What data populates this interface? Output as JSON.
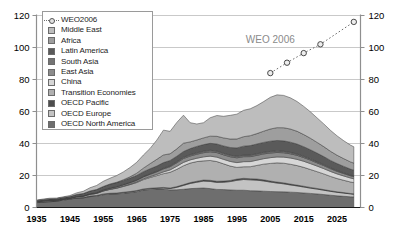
{
  "chart_data": {
    "type": "area",
    "stacked": true,
    "title": "",
    "xlabel": "",
    "ylabel": "",
    "xlim": [
      1935,
      2032
    ],
    "ylim": [
      0,
      120
    ],
    "yticks": [
      0,
      20,
      40,
      60,
      80,
      100,
      120
    ],
    "xticks": [
      1935,
      1945,
      1955,
      1965,
      1975,
      1985,
      1995,
      2005,
      2015,
      2025
    ],
    "grid": true,
    "dual_axis": true,
    "legend_position": "top-left",
    "annotations": [
      {
        "text": "WEO 2006",
        "x": 2005,
        "y": 103,
        "color": "#8a8a8a"
      }
    ],
    "x": [
      1935,
      1937,
      1939,
      1941,
      1943,
      1945,
      1947,
      1949,
      1951,
      1953,
      1955,
      1957,
      1959,
      1961,
      1963,
      1965,
      1967,
      1969,
      1971,
      1973,
      1975,
      1977,
      1979,
      1981,
      1983,
      1985,
      1987,
      1989,
      1991,
      1993,
      1995,
      1997,
      1999,
      2001,
      2003,
      2005,
      2007,
      2009,
      2011,
      2013,
      2015,
      2017,
      2019,
      2021,
      2023,
      2025,
      2027,
      2029,
      2030
    ],
    "series": [
      {
        "name": "OECD North America",
        "color": "#6e6e6e",
        "values": [
          3.0,
          3.4,
          3.6,
          3.9,
          4.6,
          5.2,
          5.9,
          6.0,
          6.8,
          7.1,
          8.0,
          8.4,
          8.5,
          8.9,
          9.3,
          9.9,
          10.9,
          11.3,
          11.5,
          11.6,
          11.0,
          11.1,
          11.4,
          11.8,
          12.0,
          12.2,
          11.8,
          11.3,
          11.2,
          11.0,
          10.8,
          10.8,
          10.5,
          10.4,
          10.2,
          10.0,
          9.9,
          9.8,
          9.6,
          9.4,
          9.1,
          8.8,
          8.5,
          8.1,
          7.7,
          7.3,
          7.0,
          6.7,
          6.6
        ]
      },
      {
        "name": "OECD Europe",
        "color": "#c3c3c3",
        "values": [
          0.2,
          0.2,
          0.2,
          0.2,
          0.3,
          0.2,
          0.2,
          0.2,
          0.3,
          0.3,
          0.4,
          0.4,
          0.4,
          0.5,
          0.5,
          0.5,
          0.5,
          0.5,
          0.5,
          0.6,
          0.8,
          1.5,
          2.4,
          3.2,
          3.8,
          4.3,
          4.5,
          4.4,
          4.6,
          5.2,
          6.2,
          6.7,
          6.8,
          6.7,
          6.4,
          5.9,
          5.4,
          5.0,
          4.5,
          4.1,
          3.7,
          3.3,
          3.0,
          2.7,
          2.4,
          2.2,
          2.0,
          1.8,
          1.7
        ]
      },
      {
        "name": "OECD Pacific",
        "color": "#4d4d4d",
        "values": [
          0.05,
          0.05,
          0.05,
          0.05,
          0.05,
          0.05,
          0.05,
          0.05,
          0.1,
          0.1,
          0.1,
          0.1,
          0.15,
          0.15,
          0.2,
          0.2,
          0.2,
          0.25,
          0.3,
          0.35,
          0.4,
          0.45,
          0.5,
          0.55,
          0.6,
          0.65,
          0.7,
          0.7,
          0.7,
          0.7,
          0.75,
          0.75,
          0.7,
          0.7,
          0.7,
          0.65,
          0.6,
          0.6,
          0.55,
          0.5,
          0.5,
          0.45,
          0.4,
          0.4,
          0.35,
          0.3,
          0.3,
          0.25,
          0.25
        ]
      },
      {
        "name": "Transition Economies",
        "color": "#b0b0b0",
        "values": [
          0.4,
          0.5,
          0.6,
          0.5,
          0.4,
          0.4,
          0.6,
          0.8,
          1.0,
          1.3,
          1.8,
          2.4,
          3.0,
          3.6,
          4.3,
          5.0,
          5.8,
          6.7,
          7.6,
          8.6,
          9.8,
          10.8,
          11.8,
          12.2,
          12.3,
          12.0,
          12.4,
          12.3,
          10.8,
          9.0,
          7.3,
          7.2,
          7.5,
          8.5,
          9.8,
          11.0,
          12.0,
          12.3,
          12.4,
          12.2,
          11.8,
          11.2,
          10.5,
          9.8,
          9.0,
          8.3,
          7.7,
          7.2,
          7.0
        ]
      },
      {
        "name": "China",
        "color": "#d6d6d6",
        "values": [
          0.01,
          0.01,
          0.01,
          0.01,
          0.01,
          0.01,
          0.02,
          0.02,
          0.03,
          0.05,
          0.1,
          0.15,
          0.2,
          0.25,
          0.3,
          0.4,
          0.5,
          0.6,
          0.8,
          1.1,
          1.5,
          1.9,
          2.1,
          2.0,
          2.1,
          2.5,
          2.7,
          2.8,
          2.8,
          2.9,
          3.0,
          3.2,
          3.2,
          3.3,
          3.4,
          3.6,
          3.7,
          3.8,
          3.9,
          3.9,
          3.8,
          3.7,
          3.5,
          3.3,
          3.1,
          2.9,
          2.7,
          2.5,
          2.4
        ]
      },
      {
        "name": "East Asia",
        "color": "#8c8c8c",
        "values": [
          0.1,
          0.1,
          0.1,
          0.1,
          0.05,
          0.05,
          0.1,
          0.2,
          0.3,
          0.4,
          0.5,
          0.6,
          0.7,
          0.8,
          0.9,
          1.0,
          1.2,
          1.4,
          1.6,
          1.9,
          2.0,
          2.2,
          2.4,
          2.4,
          2.5,
          2.6,
          2.7,
          2.8,
          2.8,
          2.9,
          3.0,
          3.1,
          3.1,
          3.0,
          3.0,
          2.9,
          2.8,
          2.7,
          2.6,
          2.5,
          2.3,
          2.2,
          2.0,
          1.9,
          1.7,
          1.6,
          1.5,
          1.4,
          1.35
        ]
      },
      {
        "name": "South Asia",
        "color": "#747474",
        "values": [
          0.03,
          0.03,
          0.03,
          0.03,
          0.03,
          0.03,
          0.04,
          0.04,
          0.05,
          0.06,
          0.08,
          0.1,
          0.12,
          0.15,
          0.2,
          0.25,
          0.3,
          0.35,
          0.4,
          0.5,
          0.6,
          0.7,
          0.8,
          0.85,
          0.9,
          0.95,
          1.0,
          1.0,
          1.0,
          1.0,
          1.0,
          1.0,
          1.0,
          1.0,
          1.0,
          1.0,
          1.0,
          0.95,
          0.9,
          0.85,
          0.8,
          0.75,
          0.7,
          0.65,
          0.6,
          0.55,
          0.5,
          0.45,
          0.45
        ]
      },
      {
        "name": "Latin America",
        "color": "#5a5a5a",
        "values": [
          0.5,
          0.6,
          0.7,
          0.7,
          0.8,
          0.9,
          1.2,
          1.4,
          1.7,
          1.9,
          2.1,
          2.4,
          2.5,
          2.6,
          2.7,
          2.8,
          3.0,
          3.1,
          3.2,
          3.4,
          3.3,
          3.4,
          3.6,
          3.8,
          4.0,
          4.1,
          4.3,
          4.4,
          4.6,
          4.8,
          5.2,
          5.6,
          5.9,
          6.1,
          6.2,
          6.4,
          6.5,
          6.5,
          6.4,
          6.2,
          6.0,
          5.7,
          5.4,
          5.0,
          4.6,
          4.3,
          4.0,
          3.7,
          3.6
        ]
      },
      {
        "name": "Africa",
        "color": "#9e9e9e",
        "values": [
          0.02,
          0.02,
          0.02,
          0.02,
          0.02,
          0.02,
          0.03,
          0.03,
          0.05,
          0.08,
          0.1,
          0.15,
          0.2,
          0.4,
          0.8,
          1.4,
          2.2,
          3.2,
          4.2,
          4.8,
          4.2,
          4.6,
          5.2,
          4.2,
          4.0,
          4.2,
          4.5,
          4.8,
          5.0,
          5.3,
          5.6,
          5.9,
          6.2,
          6.5,
          7.0,
          7.6,
          8.0,
          8.2,
          8.2,
          8.0,
          7.6,
          7.2,
          6.7,
          6.2,
          5.7,
          5.2,
          4.8,
          4.5,
          4.4
        ]
      },
      {
        "name": "Middle East",
        "color": "#bdbdbd",
        "values": [
          0.3,
          0.4,
          0.5,
          0.4,
          0.4,
          0.6,
          1.0,
          1.4,
          2.0,
          2.5,
          3.2,
          3.6,
          4.2,
          4.9,
          5.8,
          6.8,
          8.2,
          9.5,
          12.0,
          15.5,
          14.0,
          16.5,
          17.5,
          12.0,
          10.0,
          9.5,
          11.5,
          13.0,
          13.5,
          14.8,
          15.5,
          16.5,
          16.8,
          17.5,
          18.5,
          19.8,
          20.5,
          20.2,
          19.5,
          18.6,
          17.6,
          16.5,
          15.3,
          14.2,
          13.1,
          12.1,
          11.2,
          10.5,
          10.2
        ]
      }
    ],
    "projection": {
      "name": "WEO2006",
      "color": "#6f6f6f",
      "style": "dotted",
      "marker": "circle-open",
      "x": [
        2005,
        2010,
        2015,
        2020,
        2030
      ],
      "y": [
        84.0,
        90.5,
        96.5,
        102.0,
        116.0
      ]
    }
  },
  "legend": {
    "items": [
      {
        "label": "WEO2006",
        "swatch": "line-marker"
      },
      {
        "label": "Middle East",
        "swatch": "#bdbdbd"
      },
      {
        "label": "Africa",
        "swatch": "#9e9e9e"
      },
      {
        "label": "Latin America",
        "swatch": "#5a5a5a"
      },
      {
        "label": "South Asia",
        "swatch": "#747474"
      },
      {
        "label": "East Asia",
        "swatch": "#8c8c8c"
      },
      {
        "label": "China",
        "swatch": "#d6d6d6"
      },
      {
        "label": "Transition Economies",
        "swatch": "#b0b0b0"
      },
      {
        "label": "OECD Pacific",
        "swatch": "#4d4d4d"
      },
      {
        "label": "OECD Europe",
        "swatch": "#c3c3c3"
      },
      {
        "label": "OECD North America",
        "swatch": "#6e6e6e"
      }
    ]
  }
}
